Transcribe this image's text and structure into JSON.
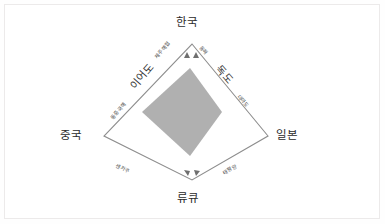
{
  "figure": {
    "title_present": false,
    "background_color": "#ffffff",
    "frame_color": "#eceaea",
    "outline_color": "#8d8d8d",
    "inner_diamond_color": "#b0b0b0"
  },
  "vertices": [
    {
      "id": "korea",
      "label": "한국",
      "position": "top"
    },
    {
      "id": "china",
      "label": "중국",
      "position": "left"
    },
    {
      "id": "japan",
      "label": "일본",
      "position": "right"
    },
    {
      "id": "ryukyu",
      "label": "류큐",
      "position": "bottom"
    }
  ],
  "edge_labels_major": [
    {
      "id": "ieodo",
      "label": "이어도",
      "edge": "china-korea"
    },
    {
      "id": "dokdo",
      "label": "독도",
      "edge": "korea-japan"
    }
  ],
  "edge_labels_minor": [
    {
      "id": "jeju-strait",
      "label": "제주해협",
      "edge": "china-korea"
    },
    {
      "id": "east-china-sea",
      "label": "동중국해",
      "edge": "china-korea"
    },
    {
      "id": "east-sea",
      "label": "동해",
      "edge": "korea-japan"
    },
    {
      "id": "tsushima",
      "label": "대마도",
      "edge": "korea-japan"
    },
    {
      "id": "senkaku",
      "label": "센카쿠",
      "edge": "china-ryukyu"
    },
    {
      "id": "pacific-ocean",
      "label": "태평양",
      "edge": "ryukyu-japan"
    }
  ],
  "arrows": {
    "at_korea": 2,
    "at_ryukyu": 2
  }
}
